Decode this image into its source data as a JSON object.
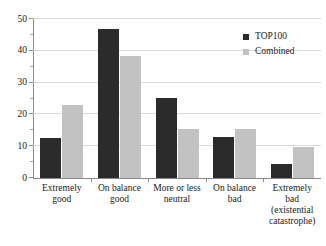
{
  "chart_data": {
    "type": "bar",
    "title": "",
    "subtitle": "",
    "xlabel": "",
    "ylabel": "",
    "ylim": [
      0,
      50
    ],
    "yticks": [
      0,
      10,
      20,
      30,
      40,
      50
    ],
    "ytick_labels": [
      "0",
      "10",
      "20",
      "30",
      "40",
      "50"
    ],
    "yminor_step": 5,
    "grid": true,
    "grid_axis": "y",
    "legend_position": "top-right",
    "categories": [
      "Extremely\ngood",
      "On balance\ngood",
      "More or less\nneutral",
      "On balance\nbad",
      "Extremely\nbad\n(existential\ncatastrophe)"
    ],
    "category_lines": [
      [
        "Extremely",
        "good"
      ],
      [
        "On balance",
        "good"
      ],
      [
        "More or less",
        "neutral"
      ],
      [
        "On balance",
        "bad"
      ],
      [
        "Extremely",
        "bad",
        "(existential",
        "catastrophe)"
      ]
    ],
    "series": [
      {
        "name": "TOP100",
        "color": "#2b2b2b",
        "values": [
          12.5,
          46.8,
          25.3,
          13.0,
          4.5
        ]
      },
      {
        "name": "Combined",
        "color": "#c2c2c2",
        "values": [
          23.0,
          38.3,
          15.3,
          15.5,
          9.7
        ]
      }
    ]
  },
  "legend": {
    "entries": [
      {
        "label": "TOP100",
        "color": "#2b2b2b"
      },
      {
        "label": "Combined",
        "color": "#c2c2c2"
      }
    ]
  },
  "axis": {
    "y_tick_labels": [
      "50",
      "40",
      "30",
      "20",
      "10",
      "0"
    ]
  },
  "colors": {
    "series_top100": "#2b2b2b",
    "series_combined": "#c2c2c2",
    "gridline": "#d9d9d9",
    "axis": "#8a8a8a",
    "text": "#1a1a1a",
    "background": "#ffffff"
  }
}
